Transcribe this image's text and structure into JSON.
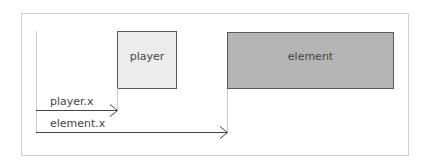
{
  "diagram": {
    "boxes": {
      "player": {
        "label": "player",
        "fill": "#ececec",
        "stroke": "#5a5a5a"
      },
      "element": {
        "label": "element",
        "fill": "#b5b5b5",
        "stroke": "#5a5a5a"
      }
    },
    "arrows": {
      "player_x": {
        "label": "player.x"
      },
      "element_x": {
        "label": "element.x"
      }
    },
    "colors": {
      "frame": "#cfcfcf",
      "guide": "#c8c8c8",
      "axis": "#cccccc",
      "arrow": "#444444",
      "text": "#444444"
    }
  }
}
